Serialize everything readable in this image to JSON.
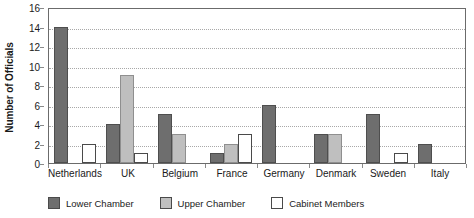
{
  "chart_data": {
    "type": "bar",
    "title": "",
    "xlabel": "",
    "ylabel": "Number of Officials",
    "ylim": [
      0,
      16
    ],
    "ytick_step": 2,
    "yticks": [
      0,
      2,
      4,
      6,
      8,
      10,
      12,
      14,
      16
    ],
    "grid": true,
    "legend_position": "bottom",
    "categories": [
      "Netherlands",
      "UK",
      "Belgium",
      "France",
      "Germany",
      "Denmark",
      "Sweden",
      "Italy"
    ],
    "series": [
      {
        "name": "Lower Chamber",
        "color": "#6e6e6e",
        "values": [
          14,
          4,
          5,
          1,
          6,
          3,
          5,
          2
        ]
      },
      {
        "name": "Upper Chamber",
        "color": "#bfbfbf",
        "values": [
          0,
          9,
          3,
          2,
          0,
          3,
          0,
          0
        ]
      },
      {
        "name": "Cabinet Members",
        "color": "#ffffff",
        "values": [
          2,
          1,
          0,
          3,
          0,
          0,
          1,
          0
        ]
      }
    ]
  },
  "axis": {
    "y_title": "Number of Officials",
    "y_tick_labels": [
      "16",
      "14",
      "12",
      "10",
      "8",
      "6",
      "4",
      "2",
      "0"
    ],
    "x_tick_labels": [
      "Netherlands",
      "UK",
      "Belgium",
      "France",
      "Germany",
      "Denmark",
      "Sweden",
      "Italy"
    ]
  },
  "legend": {
    "items": [
      {
        "label": "Lower Chamber",
        "color": "#6e6e6e"
      },
      {
        "label": "Upper Chamber",
        "color": "#bfbfbf"
      },
      {
        "label": "Cabinet Members",
        "color": "#ffffff"
      }
    ]
  }
}
